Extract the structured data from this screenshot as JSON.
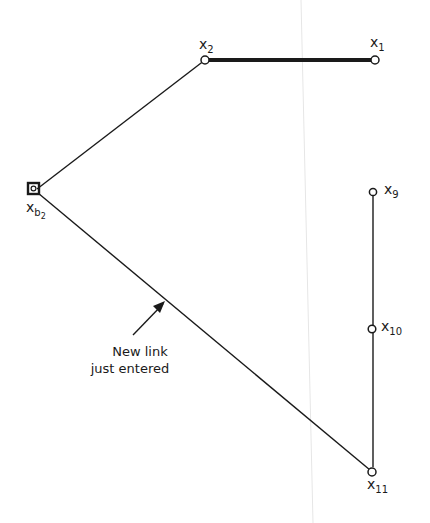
{
  "diagram": {
    "nodes": [
      {
        "id": "xb2",
        "base": "x",
        "sub": "b",
        "subsub": "2",
        "shape": "square-with-circle"
      },
      {
        "id": "x2",
        "base": "x",
        "sub": "2",
        "shape": "circle"
      },
      {
        "id": "x1",
        "base": "x",
        "sub": "1",
        "shape": "circle"
      },
      {
        "id": "x9",
        "base": "x",
        "sub": "9",
        "shape": "circle"
      },
      {
        "id": "x10",
        "base": "x",
        "sub": "10",
        "shape": "circle"
      },
      {
        "id": "x11",
        "base": "x",
        "sub": "11",
        "shape": "circle"
      }
    ],
    "links": [
      {
        "from": "xb2",
        "to": "x2",
        "style": "thin"
      },
      {
        "from": "x2",
        "to": "x1",
        "style": "thick"
      },
      {
        "from": "x9",
        "to": "x10",
        "style": "thin"
      },
      {
        "from": "x10",
        "to": "x11",
        "style": "thin"
      },
      {
        "from": "xb2",
        "to": "x11",
        "style": "thin",
        "annotated": true
      }
    ],
    "annotation": {
      "line1": "New link",
      "line2": "just entered",
      "points_to": "xb2-x11"
    },
    "colors": {
      "ink": "#1a1a1a",
      "background": "#ffffff"
    }
  }
}
